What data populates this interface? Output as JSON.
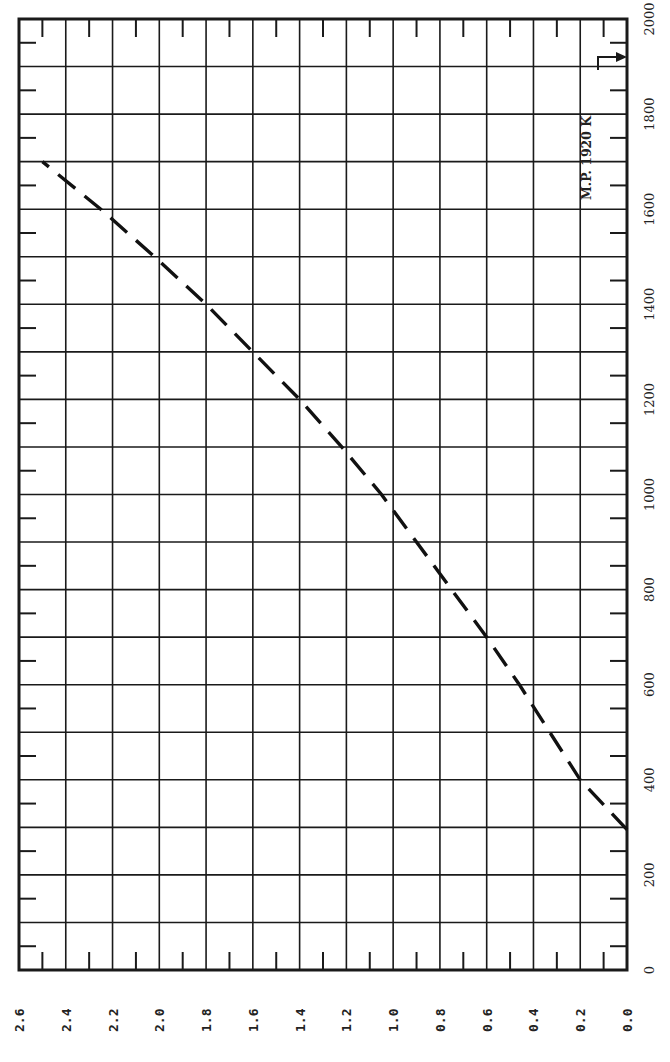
{
  "chart_data": {
    "type": "line",
    "orientation": "rotated-90-ccw",
    "title": "",
    "xlabel": "Temperature (K)",
    "ylabel": "",
    "xlim": [
      0,
      2000
    ],
    "ylim": [
      0.0,
      2.6
    ],
    "x_ticks": [
      0,
      200,
      400,
      600,
      800,
      1000,
      1200,
      1400,
      1600,
      1800,
      2000
    ],
    "x_tick_labels": [
      "0",
      "200",
      "400",
      "600",
      "800",
      "1000",
      "1200",
      "1400",
      "1600",
      "1800",
      "2000"
    ],
    "y_ticks": [
      0.0,
      0.2,
      0.4,
      0.6,
      0.8,
      1.0,
      1.2,
      1.4,
      1.6,
      1.8,
      2.0,
      2.2,
      2.4,
      2.6
    ],
    "y_tick_labels": [
      "0.0",
      "0.2",
      "0.4",
      "0.6",
      "0.8",
      "1.0",
      "1.2",
      "1.4",
      "1.6",
      "1.8",
      "2.0",
      "2.2",
      "2.4",
      "2.6"
    ],
    "grid": true,
    "legend": null,
    "series": [
      {
        "name": "curve",
        "style": "dashed",
        "x": [
          295,
          400,
          500,
          600,
          700,
          800,
          900,
          1000,
          1100,
          1200,
          1300,
          1400,
          1500,
          1600,
          1700
        ],
        "y": [
          0.0,
          0.2,
          0.33,
          0.46,
          0.6,
          0.75,
          0.9,
          1.05,
          1.22,
          1.4,
          1.6,
          1.8,
          2.02,
          2.25,
          2.5
        ]
      }
    ],
    "annotations": [
      {
        "text": "M.P. 1920 K",
        "x": 1920,
        "type": "arrow-to-axis"
      }
    ]
  },
  "labels": {
    "annotation": "M.P. 1920 K"
  }
}
